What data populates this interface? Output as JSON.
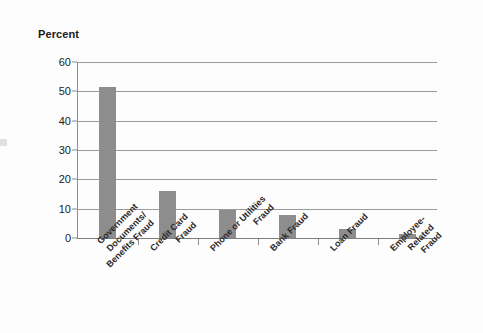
{
  "chart_data": {
    "type": "bar",
    "title": "",
    "ylabel": "Percent",
    "xlabel": "",
    "categories": [
      "Government Documents/ Benefits Fraud",
      "Credit Card Fraud",
      "Phone or Utilities Fraud",
      "Bank Fraud",
      "Loan Fraud",
      "Employee- Related Fraud"
    ],
    "category_lines": [
      [
        "Government",
        "Documents/",
        "Benefits Fraud"
      ],
      [
        "Credit Card",
        "Fraud"
      ],
      [
        "Phone or Utilities",
        "Fraud"
      ],
      [
        "Bank Fraud"
      ],
      [
        "Loan Fraud"
      ],
      [
        "Employee-",
        "Related",
        "Fraud"
      ]
    ],
    "values": [
      51.5,
      16,
      9.5,
      8,
      3,
      1.5
    ],
    "ylim": [
      0,
      60
    ],
    "yticks": [
      0,
      10,
      20,
      30,
      40,
      50,
      60
    ],
    "ytick_labels": [
      "0",
      "10",
      "20",
      "30",
      "40",
      "50",
      "60"
    ],
    "grid": true,
    "legend": false,
    "bar_color": "#8d8d8d",
    "axis_color": "#8e8e8e",
    "text_color": "#231f20",
    "background": "#ffffff"
  },
  "axis": {
    "y_title": "Percent"
  }
}
